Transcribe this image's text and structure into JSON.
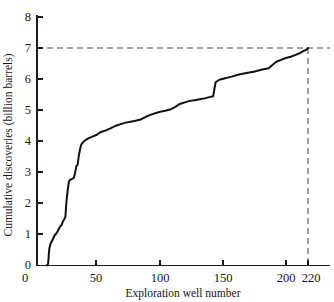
{
  "chart_data": {
    "type": "line",
    "title": "",
    "subtitle": "",
    "xlabel": "Exploration well number",
    "ylabel": "Cumulative discoveries (billion barrels)",
    "xlim": [
      0,
      235
    ],
    "ylim": [
      0,
      8
    ],
    "xticks": [
      0,
      50,
      100,
      150,
      200,
      220
    ],
    "xtick_labels": [
      "0",
      "50",
      "100",
      "150",
      "200",
      "220"
    ],
    "yticks": [
      0,
      1,
      2,
      3,
      4,
      5,
      6,
      7,
      8
    ],
    "ytick_labels": [
      "0",
      "1",
      "2",
      "3",
      "4",
      "5",
      "6",
      "7",
      "8"
    ],
    "grid": false,
    "legend": "none",
    "series": [
      {
        "name": "Cumulative discoveries",
        "style": "step-like creaming curve",
        "color": "#111111",
        "x": [
          8,
          9,
          10,
          11,
          12,
          13,
          14,
          15,
          16,
          17,
          18,
          19,
          20,
          21,
          22,
          23,
          24,
          25,
          26,
          27,
          28,
          29,
          30,
          31,
          32,
          33,
          34,
          35,
          36,
          38,
          40,
          42,
          45,
          48,
          52,
          56,
          60,
          64,
          68,
          72,
          76,
          80,
          84,
          88,
          92,
          96,
          100,
          104,
          108,
          112,
          116,
          120,
          124,
          128,
          132,
          136,
          140,
          143,
          145,
          148,
          152,
          158,
          164,
          170,
          176,
          182,
          188,
          194,
          198,
          202,
          206,
          210,
          214,
          217,
          219,
          220
        ],
        "y": [
          0.0,
          0.05,
          0.55,
          0.7,
          0.78,
          0.85,
          0.95,
          1.0,
          1.05,
          1.12,
          1.2,
          1.27,
          1.3,
          1.42,
          1.48,
          1.55,
          2.1,
          2.45,
          2.72,
          2.76,
          2.78,
          2.8,
          2.82,
          3.0,
          3.2,
          3.25,
          3.55,
          3.75,
          3.9,
          4.0,
          4.05,
          4.1,
          4.15,
          4.2,
          4.3,
          4.35,
          4.42,
          4.5,
          4.55,
          4.6,
          4.63,
          4.66,
          4.7,
          4.78,
          4.85,
          4.9,
          4.95,
          4.98,
          5.02,
          5.1,
          5.2,
          5.25,
          5.3,
          5.32,
          5.35,
          5.38,
          5.42,
          5.45,
          5.9,
          5.98,
          6.02,
          6.08,
          6.15,
          6.2,
          6.24,
          6.3,
          6.35,
          6.55,
          6.62,
          6.68,
          6.72,
          6.78,
          6.85,
          6.92,
          6.96,
          7.0
        ]
      }
    ],
    "annotations": [
      {
        "name": "asymptote-dashed-horizontal",
        "type": "dashed-line",
        "orientation": "horizontal",
        "y": 7,
        "x_from": 0,
        "x_to": 232,
        "color": "#4a4a4a"
      },
      {
        "name": "endpoint-dashed-vertical",
        "type": "dashed-line",
        "orientation": "vertical",
        "x": 220,
        "y_from": 0,
        "y_to": 7,
        "color": "#4a4a4a"
      }
    ]
  },
  "axes": {
    "x_title": "Exploration well number",
    "y_title": "Cumulative discoveries (billion barrels)",
    "x_labels": [
      "0",
      "50",
      "100",
      "150",
      "200",
      "220"
    ],
    "y_labels": [
      "0",
      "1",
      "2",
      "3",
      "4",
      "5",
      "6",
      "7",
      "8"
    ]
  }
}
